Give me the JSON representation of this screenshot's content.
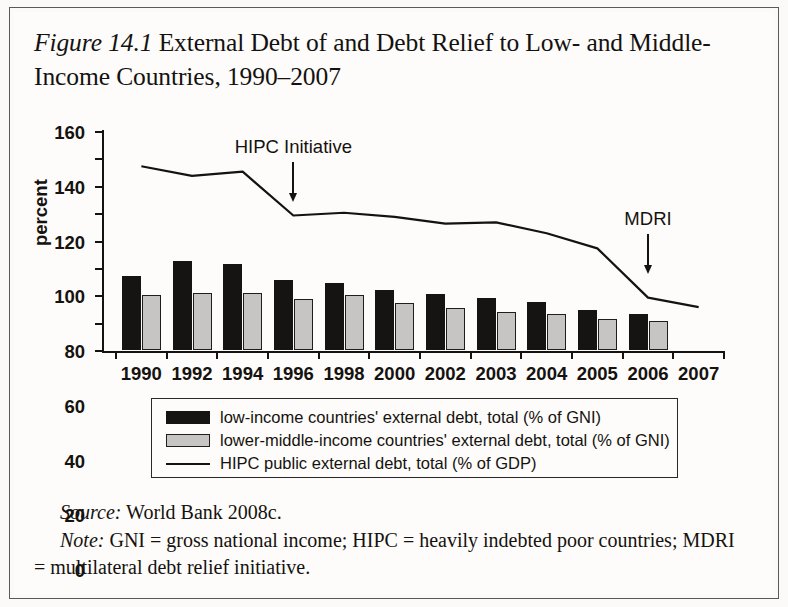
{
  "figure": {
    "label": "Figure 14.1",
    "title": " External Debt of and Debt Relief to Low- and Middle-Income Countries, 1990–2007"
  },
  "source": {
    "label": "Source:",
    "text": " World Bank 2008c."
  },
  "note": {
    "label": "Note:",
    "text": " GNI = gross national income; HIPC = heavily indebted poor countries; MDRI = multilateral debt relief initiative."
  },
  "legend": {
    "items": [
      {
        "swatch": "dark-square",
        "label": "low-income countries' external debt, total (% of GNI)"
      },
      {
        "swatch": "light-square",
        "label": "lower-middle-income countries' external debt, total (% of GNI)"
      },
      {
        "swatch": "line",
        "label": "HIPC public external debt, total (% of GDP)"
      }
    ]
  },
  "chart_data": {
    "type": "bar",
    "title": "External Debt of and Debt Relief to Low- and Middle-Income Countries, 1990–2007",
    "xlabel": "",
    "ylabel": "percent",
    "ylim": [
      0,
      160
    ],
    "yticks": [
      0,
      20,
      40,
      60,
      80,
      100,
      120,
      140,
      160
    ],
    "grid": false,
    "legend_position": "bottom",
    "categories": [
      "1990",
      "1992",
      "1994",
      "1996",
      "1998",
      "2000",
      "2002",
      "2003",
      "2004",
      "2005",
      "2006",
      "2007"
    ],
    "series": [
      {
        "name": "low-income countries' external debt, total (% of GNI)",
        "kind": "bar",
        "color": "#161413",
        "values": [
          54,
          65,
          63,
          51,
          49,
          44,
          41,
          38,
          35,
          29,
          26,
          null
        ]
      },
      {
        "name": "lower-middle-income countries' external debt, total (% of GNI)",
        "kind": "bar",
        "color": "#c6c5c3",
        "values": [
          40,
          42,
          42,
          37,
          40,
          34,
          31,
          28,
          26,
          23,
          21,
          null
        ]
      },
      {
        "name": "HIPC public external debt, total (% of GDP)",
        "kind": "line",
        "color": "#15120f",
        "values": [
          135,
          128,
          131,
          99,
          101,
          98,
          93,
          94,
          86,
          75,
          39,
          32
        ]
      }
    ],
    "annotations": [
      {
        "text": "HIPC Initiative",
        "points_to": "1996",
        "arrow": "down"
      },
      {
        "text": "MDRI",
        "points_to": "2006",
        "arrow": "down"
      }
    ]
  }
}
